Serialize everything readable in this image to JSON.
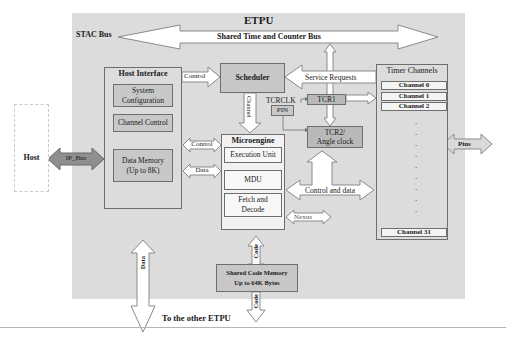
{
  "diagram": {
    "title": "ETPU",
    "stac_bus_label": "STAC Bus",
    "shared_bus_label": "Shared Time  and Counter Bus",
    "host": {
      "label": "Host",
      "ip_bus_label": "IP_Bus"
    },
    "host_interface": {
      "title": "Host Interface",
      "blocks": [
        "System Configuration",
        "Channel Control",
        "Data Memory (Up to 8K)"
      ],
      "system_config_line1": "System",
      "system_config_line2": "Configuration",
      "channel_control": "Channel Control",
      "data_memory_line1": "Data Memory",
      "data_memory_line2": "(Up to 8K)"
    },
    "scheduler": {
      "label": "Scheduler",
      "control_in_label": "Control",
      "service_requests_label": "Service Requests",
      "channel_label": "Channel"
    },
    "microengine": {
      "title": "Microengine",
      "blocks": [
        "Execution Unit",
        "MDU",
        "Fetch and Decode"
      ],
      "execution_unit": "Execution Unit",
      "mdu": "MDU",
      "fetch_line1": "Fetch and",
      "fetch_line2": "Decode",
      "control_label": "Control",
      "data_label": "Data",
      "nexus_label": "Nexus"
    },
    "timers": {
      "tcrclk_label": "TCRCLK",
      "pin_label": "PIN",
      "tcr1_label": "TCR1",
      "tcr2_line1": "TCR2/",
      "tcr2_line2": "Angle clock",
      "control_and_data_label": "Control and data"
    },
    "timer_channels": {
      "title": "Timer Channels",
      "channels": [
        "Channel 0",
        "Channel 1",
        "Channel 2",
        "Channel 31"
      ],
      "pins_label": "Pins"
    },
    "code_memory": {
      "line1": "Shared Code Memory",
      "line2": "Up to 64K Bytes",
      "code_label_upper": "Code",
      "code_label_lower": "Code"
    },
    "data_bus_label": "Data",
    "other_etpu_label": "To the other ETPU",
    "colors": {
      "etpu_background": "#dcdcdc",
      "block_fill": "#c8c8c8",
      "tcr_fill": "#b9b9b9",
      "ip_bus_fill": "#8f8f8f",
      "pins_fill": "#d9d9d9",
      "arrow_fill": "#ffffff",
      "border": "#6e6e6e"
    }
  }
}
